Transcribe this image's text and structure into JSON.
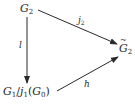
{
  "diagram": {
    "type": "commutative-diagram",
    "nodes": [
      {
        "id": "top",
        "base": "G",
        "sub": "2",
        "accent": ""
      },
      {
        "id": "right",
        "base": "G",
        "sub": "2",
        "accent": "tilde"
      },
      {
        "id": "bottom",
        "text_a": "G",
        "sub_a": "1",
        "slash": "/",
        "text_b": "j",
        "sub_b": "1",
        "paren_open": "(",
        "text_c": "G",
        "sub_c": "0",
        "paren_close": ")"
      }
    ],
    "edges": [
      {
        "from": "top",
        "to": "right",
        "label": "j",
        "label_sub": "2"
      },
      {
        "from": "top",
        "to": "bottom",
        "label": "l",
        "label_sub": ""
      },
      {
        "from": "bottom",
        "to": "right",
        "label": "h",
        "label_sub": ""
      }
    ],
    "colors": {
      "ink": "#2a2a2a",
      "background": "#ffffff"
    }
  }
}
